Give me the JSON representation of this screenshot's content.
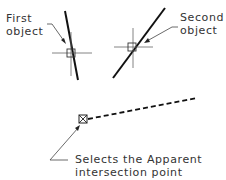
{
  "diagram": {
    "title": "",
    "labels": {
      "first_object_line1": "First",
      "first_object_line2": "object",
      "second_object_line1": "Second",
      "second_object_line2": "object",
      "caption_line1": "Selects the Apparent",
      "caption_line2": "intersection point"
    },
    "colors": {
      "line": "#111111",
      "thin": "#555555",
      "text": "#333333",
      "background": "#ffffff"
    }
  }
}
